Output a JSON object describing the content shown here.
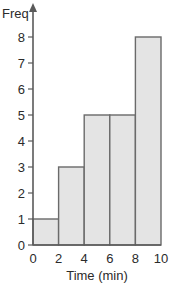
{
  "chart_data": {
    "type": "bar",
    "subtype": "histogram",
    "title": "",
    "xlabel": "Time (min)",
    "ylabel": "Freq",
    "bins": [
      {
        "from": 0,
        "to": 2,
        "value": 1
      },
      {
        "from": 2,
        "to": 4,
        "value": 3
      },
      {
        "from": 4,
        "to": 6,
        "value": 5
      },
      {
        "from": 6,
        "to": 8,
        "value": 5
      },
      {
        "from": 8,
        "to": 10,
        "value": 8
      }
    ],
    "categories": [
      "0-2",
      "2-4",
      "4-6",
      "6-8",
      "8-10"
    ],
    "values": [
      1,
      3,
      5,
      5,
      8
    ],
    "x_ticks": [
      0,
      2,
      4,
      6,
      8,
      10
    ],
    "y_ticks": [
      0,
      1,
      2,
      3,
      4,
      5,
      6,
      7,
      8
    ],
    "xlim": [
      0,
      10
    ],
    "ylim": [
      0,
      8
    ],
    "grid": false,
    "legend": null
  },
  "colors": {
    "bar_fill": "#e4e4e4",
    "bar_stroke": "#6a6a6a",
    "axis": "#5a5a5a",
    "text": "#2b2b2b"
  }
}
